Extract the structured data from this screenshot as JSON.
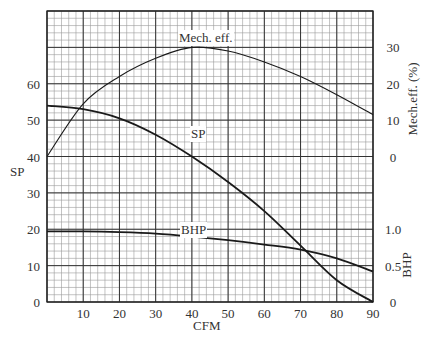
{
  "chart_data": {
    "type": "line",
    "title": "",
    "xlabel": "CFM",
    "ylabel": "SP",
    "ylabel_right_upper": "Mech.eff. (%)",
    "ylabel_right_lower": "BHP",
    "xlim": [
      0,
      90
    ],
    "ylim": [
      0,
      80
    ],
    "grid": true,
    "x_ticks": [
      10,
      20,
      30,
      40,
      50,
      60,
      70,
      80,
      90
    ],
    "y_ticks": [
      0,
      10,
      20,
      30,
      40,
      50,
      60
    ],
    "right_upper_ticks": [
      0,
      10,
      20,
      30
    ],
    "right_lower_ticks": [
      "0",
      "0.5",
      "1.0"
    ],
    "x": [
      0,
      10,
      20,
      30,
      40,
      50,
      60,
      70,
      80,
      90
    ],
    "series": [
      {
        "name": "SP",
        "axis": "left",
        "values": [
          54,
          53,
          50.5,
          46,
          40,
          33,
          25,
          15.5,
          6,
          0
        ]
      },
      {
        "name": "Mech. eff.",
        "axis": "right_upper",
        "unit": "%",
        "values": [
          0,
          14.5,
          22,
          27,
          30,
          29,
          26,
          22,
          17,
          11.5
        ]
      },
      {
        "name": "BHP",
        "axis": "right_lower",
        "values": [
          0.97,
          0.97,
          0.96,
          0.94,
          0.9,
          0.85,
          0.79,
          0.72,
          0.6,
          0.42
        ]
      }
    ],
    "annotations": [
      "Mech. eff.",
      "SP",
      "BHP"
    ]
  },
  "labels": {
    "xlabel": "CFM",
    "ylabel": "SP",
    "right_upper": "Mech.eff. (%)",
    "right_lower": "BHP",
    "curve_eff": "Mech. eff.",
    "curve_sp": "SP",
    "curve_bhp": "BHP"
  }
}
